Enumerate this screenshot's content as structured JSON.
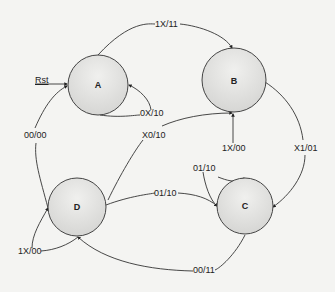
{
  "diagram": {
    "type": "state-machine",
    "states": [
      {
        "id": "A",
        "label": "A"
      },
      {
        "id": "B",
        "label": "B"
      },
      {
        "id": "C",
        "label": "C"
      },
      {
        "id": "D",
        "label": "D"
      }
    ],
    "reset": {
      "label": "Rst",
      "target": "A"
    },
    "transitions": [
      {
        "from": "A",
        "to": "B",
        "label": "1X/11"
      },
      {
        "from": "A",
        "to": "A",
        "label": "0X/10"
      },
      {
        "from": "D",
        "to": "A",
        "label": "00/00"
      },
      {
        "from": "D",
        "to": "B",
        "label": "X0/10"
      },
      {
        "from": "C",
        "to": "B",
        "label": "1X/00"
      },
      {
        "from": "B",
        "to": "C",
        "label": "X1/01"
      },
      {
        "from": "C",
        "to": "C",
        "label": "01/10"
      },
      {
        "from": "D",
        "to": "C",
        "label": "01/10"
      },
      {
        "from": "D",
        "to": "D",
        "label": "1X/00"
      },
      {
        "from": "C",
        "to": "D",
        "label": "00/11"
      }
    ]
  }
}
